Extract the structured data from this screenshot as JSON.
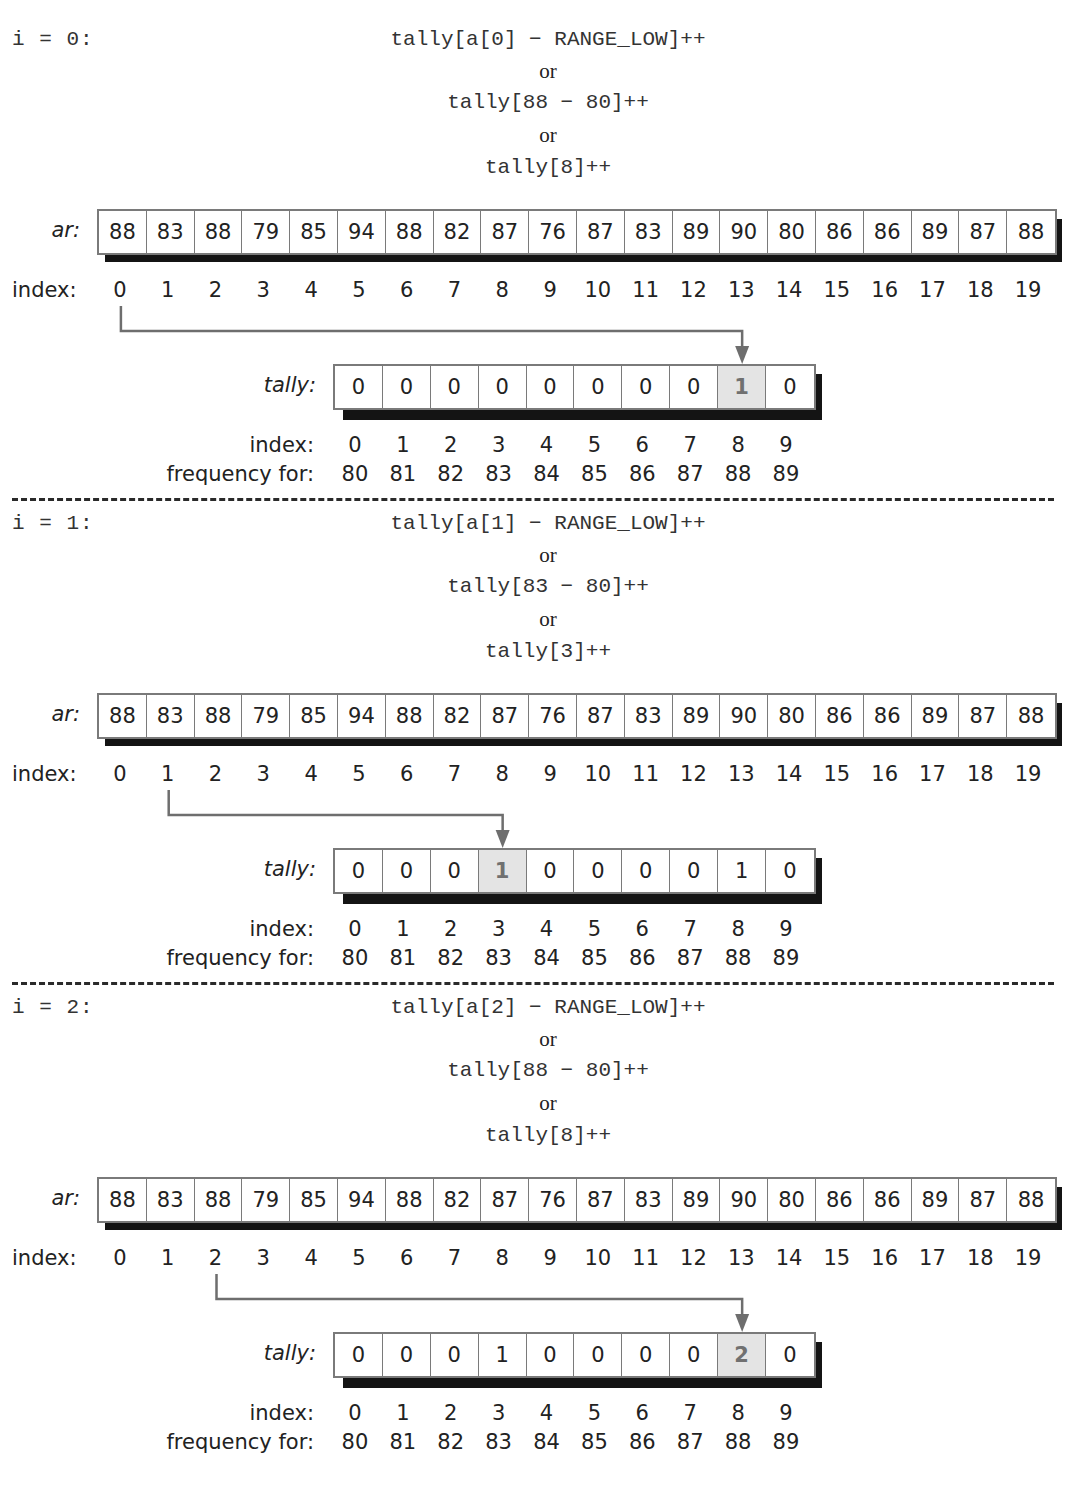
{
  "labels": {
    "ar": "ar:",
    "index": "index:",
    "tally": "tally:",
    "frequency_for": "frequency for:",
    "or": "or"
  },
  "ar_values": [
    "88",
    "83",
    "88",
    "79",
    "85",
    "94",
    "88",
    "82",
    "87",
    "76",
    "87",
    "83",
    "89",
    "90",
    "80",
    "86",
    "86",
    "89",
    "87",
    "88"
  ],
  "ar_indices": [
    "0",
    "1",
    "2",
    "3",
    "4",
    "5",
    "6",
    "7",
    "8",
    "9",
    "10",
    "11",
    "12",
    "13",
    "14",
    "15",
    "16",
    "17",
    "18",
    "19"
  ],
  "tally_indices": [
    "0",
    "1",
    "2",
    "3",
    "4",
    "5",
    "6",
    "7",
    "8",
    "9"
  ],
  "frequency_for": [
    "80",
    "81",
    "82",
    "83",
    "84",
    "85",
    "86",
    "87",
    "88",
    "89"
  ],
  "colors": {
    "highlight_cell": "#e4e4e4",
    "shadow": "#141414",
    "border": "#7a7a7a",
    "arrow": "#6e6e6e"
  },
  "steps": [
    {
      "iter_label": "i = 0:",
      "expr_general": "tally[a[0] − RANGE_LOW]++",
      "expr_substituted": "tally[88 − 80]++",
      "expr_result": "tally[8]++",
      "source_index": 0,
      "target_index": 8,
      "tally_values": [
        "0",
        "0",
        "0",
        "0",
        "0",
        "0",
        "0",
        "0",
        "1",
        "0"
      ]
    },
    {
      "iter_label": "i = 1:",
      "expr_general": "tally[a[1] − RANGE_LOW]++",
      "expr_substituted": "tally[83 − 80]++",
      "expr_result": "tally[3]++",
      "source_index": 1,
      "target_index": 3,
      "tally_values": [
        "0",
        "0",
        "0",
        "1",
        "0",
        "0",
        "0",
        "0",
        "1",
        "0"
      ]
    },
    {
      "iter_label": "i = 2:",
      "expr_general": "tally[a[2] − RANGE_LOW]++",
      "expr_substituted": "tally[88 − 80]++",
      "expr_result": "tally[8]++",
      "source_index": 2,
      "target_index": 8,
      "tally_values": [
        "0",
        "0",
        "0",
        "1",
        "0",
        "0",
        "0",
        "0",
        "2",
        "0"
      ]
    }
  ]
}
